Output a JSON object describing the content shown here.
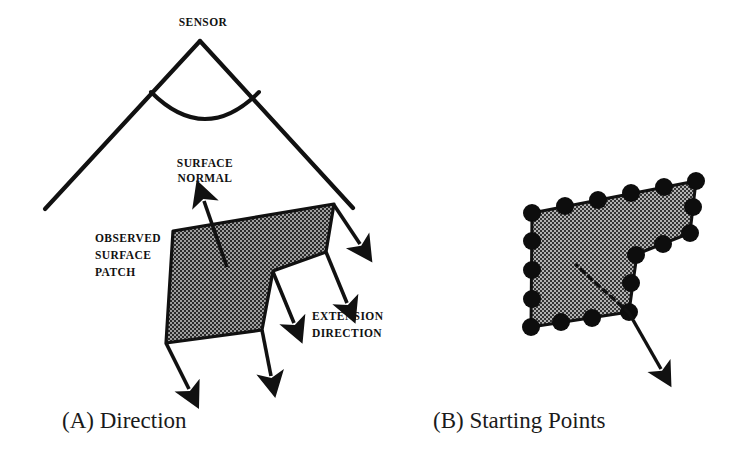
{
  "figure": {
    "background_color": "#ffffff",
    "ink_color": "#111111",
    "panels": [
      {
        "id": "A",
        "caption": "(A) Direction",
        "caption_position": {
          "x": 62,
          "y": 428
        },
        "labels": [
          {
            "name": "sensor-label",
            "text": "SENSOR",
            "x": 203,
            "y": 26,
            "anchor": "middle"
          },
          {
            "name": "surface-normal-label-line1",
            "text": "SURFACE",
            "x": 205,
            "y": 167,
            "anchor": "middle"
          },
          {
            "name": "surface-normal-label-line2",
            "text": "NORMAL",
            "x": 205,
            "y": 182,
            "anchor": "middle"
          },
          {
            "name": "observed-surface-patch-label-line1",
            "text": "OBSERVED",
            "x": 95,
            "y": 242,
            "anchor": "start"
          },
          {
            "name": "observed-surface-patch-label-line2",
            "text": "SURFACE",
            "x": 95,
            "y": 259,
            "anchor": "start"
          },
          {
            "name": "observed-surface-patch-label-line3",
            "text": "PATCH",
            "x": 95,
            "y": 276,
            "anchor": "start"
          },
          {
            "name": "extension-direction-label-line1",
            "text": "EXTENSION",
            "x": 312,
            "y": 320,
            "anchor": "start"
          },
          {
            "name": "extension-direction-label-line2",
            "text": "DIRECTION",
            "x": 312,
            "y": 337,
            "anchor": "start"
          }
        ],
        "sensor_apex": {
          "x": 200,
          "y": 41
        },
        "view_cone": {
          "left_ray_end": {
            "x": 45,
            "y": 209
          },
          "right_ray_end": {
            "x": 353,
            "y": 208
          },
          "arc_start": {
            "x": 151,
            "y": 92
          },
          "arc_end": {
            "x": 259,
            "y": 92
          },
          "arc_sag": 31
        },
        "surface_patch_polygon": [
          {
            "x": 173,
            "y": 231
          },
          {
            "x": 334,
            "y": 204
          },
          {
            "x": 326,
            "y": 252
          },
          {
            "x": 273,
            "y": 271
          },
          {
            "x": 262,
            "y": 330
          },
          {
            "x": 166,
            "y": 343
          }
        ],
        "surface_normal_arrow": {
          "from": {
            "x": 227,
            "y": 267
          },
          "to": {
            "x": 201,
            "y": 196
          }
        },
        "extension_arrows": [
          {
            "name": "extension-arrow-top-right",
            "from": {
              "x": 334,
              "y": 205
            },
            "to": {
              "x": 363,
              "y": 249
            }
          },
          {
            "name": "extension-arrow-right",
            "from": {
              "x": 326,
              "y": 252
            },
            "to": {
              "x": 350,
              "y": 310
            }
          },
          {
            "name": "extension-arrow-notch",
            "from": {
              "x": 273,
              "y": 272
            },
            "to": {
              "x": 297,
              "y": 330
            }
          },
          {
            "name": "extension-arrow-bottom-mid",
            "from": {
              "x": 262,
              "y": 330
            },
            "to": {
              "x": 273,
              "y": 383
            }
          },
          {
            "name": "extension-arrow-bottom-left",
            "from": {
              "x": 166,
              "y": 343
            },
            "to": {
              "x": 192,
              "y": 396
            }
          }
        ]
      },
      {
        "id": "B",
        "caption": "(B) Starting Points",
        "caption_position": {
          "x": 433,
          "y": 428
        },
        "labels": [],
        "surface_patch_polygon": [
          {
            "x": 532,
            "y": 213
          },
          {
            "x": 696,
            "y": 181
          },
          {
            "x": 690,
            "y": 233
          },
          {
            "x": 637,
            "y": 254
          },
          {
            "x": 629,
            "y": 312
          },
          {
            "x": 531,
            "y": 327
          }
        ],
        "boundary_points": [
          {
            "x": 532,
            "y": 213
          },
          {
            "x": 532,
            "y": 241
          },
          {
            "x": 532,
            "y": 270
          },
          {
            "x": 532,
            "y": 299
          },
          {
            "x": 531,
            "y": 327
          },
          {
            "x": 561,
            "y": 322
          },
          {
            "x": 592,
            "y": 318
          },
          {
            "x": 623,
            "y": 313
          },
          {
            "x": 629,
            "y": 312
          },
          {
            "x": 631,
            "y": 283
          },
          {
            "x": 635,
            "y": 256
          },
          {
            "x": 637,
            "y": 254
          },
          {
            "x": 663,
            "y": 244
          },
          {
            "x": 690,
            "y": 233
          },
          {
            "x": 693,
            "y": 207
          },
          {
            "x": 696,
            "y": 181
          },
          {
            "x": 664,
            "y": 187
          },
          {
            "x": 631,
            "y": 193
          },
          {
            "x": 598,
            "y": 200
          },
          {
            "x": 565,
            "y": 206
          }
        ],
        "point_radius": 9,
        "dashed_normal": {
          "from": {
            "x": 629,
            "y": 313
          },
          "to": {
            "x": 576,
            "y": 265
          }
        },
        "extension_arrow": {
          "from": {
            "x": 629,
            "y": 313
          },
          "to": {
            "x": 664,
            "y": 375
          }
        }
      }
    ]
  }
}
